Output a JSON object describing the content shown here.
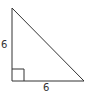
{
  "diagram": {
    "shape": "right triangle",
    "labels": {
      "left_leg": "6",
      "bottom_leg": "6"
    },
    "vertices": {
      "top": [
        12,
        8
      ],
      "bottom_left": [
        12,
        81
      ],
      "bottom_right": [
        84,
        81
      ]
    },
    "right_angle_marker": true,
    "colors": {
      "stroke": "#333333",
      "background": "#ffffff"
    }
  }
}
